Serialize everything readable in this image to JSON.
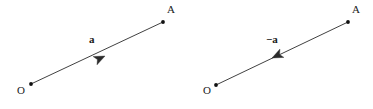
{
  "figure": {
    "background_color": "#ffffff",
    "stroke_color": "#2b2b2b",
    "dot_color": "#111111",
    "width": 373,
    "height": 109
  },
  "diagrams": [
    {
      "id": "vector-a",
      "label": "a",
      "direction": "O-to-A",
      "origin_label": "O",
      "tip_label": "A",
      "origin_point": {
        "x": 31,
        "y": 84
      },
      "tip_point": {
        "x": 163,
        "y": 22
      },
      "arrowhead_at": {
        "x": 105,
        "y": 56
      },
      "arrowhead_points_toward": "A"
    },
    {
      "id": "vector-minus-a",
      "label": "−a",
      "direction": "A-to-O",
      "origin_label": "O",
      "tip_label": "A",
      "origin_point": {
        "x": 216,
        "y": 85
      },
      "tip_point": {
        "x": 348,
        "y": 22
      },
      "arrowhead_at": {
        "x": 272,
        "y": 58
      },
      "arrowhead_points_toward": "O"
    }
  ]
}
